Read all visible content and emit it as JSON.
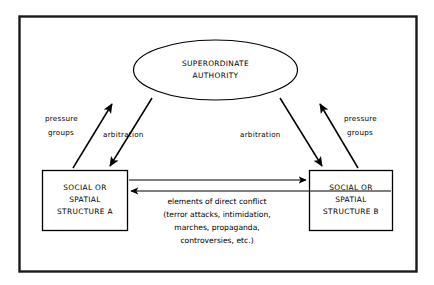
{
  "diagram": {
    "title_shape": "ellipse",
    "frame": {
      "name": "outer-border",
      "color": "#000000"
    },
    "background_color": "#ffffff",
    "line_color": "#000000",
    "nodes": {
      "authority": {
        "shape": "ellipse",
        "line1": "SUPERORDINATE",
        "line2": "AUTHORITY"
      },
      "structure_a": {
        "shape": "rectangle",
        "line1": "SOCIAL OR",
        "line2": "SPATIAL",
        "line3": "STRUCTURE A"
      },
      "structure_b": {
        "shape": "rectangle",
        "line1": "SOCIAL OR",
        "line2": "SPATIAL",
        "line3": "STRUCTURE B"
      }
    },
    "edge_labels": {
      "left_pressure": {
        "line1": "pressure",
        "line2": "groups"
      },
      "left_arbitration": {
        "line1": "arbitration"
      },
      "right_arbitration": {
        "line1": "arbitration"
      },
      "right_pressure": {
        "line1": "pressure",
        "line2": "groups"
      }
    },
    "conflict": {
      "line1": "elements of direct conflict",
      "line2": "(terror attacks, intimidation,",
      "line3": "marches, propaganda,",
      "line4": "controversies, etc.)"
    }
  }
}
